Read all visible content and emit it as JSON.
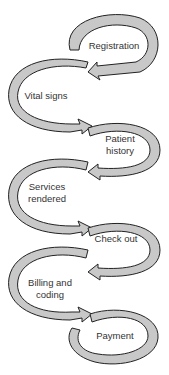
{
  "diagram": {
    "type": "process-flow",
    "style": {
      "arrow_fill": "#c8c8c8",
      "arrow_stroke": "#222222",
      "text_color": "#333333",
      "background": "#ffffff"
    },
    "steps": [
      {
        "id": "registration",
        "label": "Registration",
        "side": "right"
      },
      {
        "id": "vital-signs",
        "label": "Vital signs",
        "side": "left"
      },
      {
        "id": "patient-history",
        "label_line1": "Patient",
        "label_line2": "history",
        "side": "right"
      },
      {
        "id": "services-rendered",
        "label_line1": "Services",
        "label_line2": "rendered",
        "side": "left"
      },
      {
        "id": "check-out",
        "label": "Check out",
        "side": "right"
      },
      {
        "id": "billing-and-coding",
        "label_line1": "Billing and",
        "label_line2": "coding",
        "side": "left"
      },
      {
        "id": "payment",
        "label": "Payment",
        "side": "right"
      }
    ],
    "flow": [
      "registration",
      "vital-signs",
      "patient-history",
      "services-rendered",
      "check-out",
      "billing-and-coding",
      "payment"
    ]
  }
}
